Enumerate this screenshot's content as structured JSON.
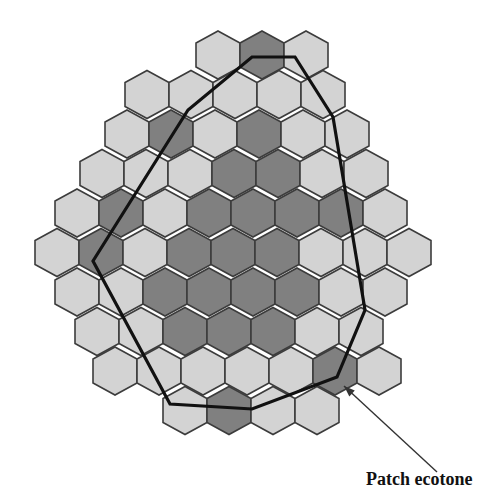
{
  "figure": {
    "label": "Patch ecotone",
    "colors": {
      "light_cell": "#d3d3d3",
      "dark_cell": "#808080",
      "cell_stroke": "#3c3c3c",
      "boundary": "#111111",
      "background": "#ffffff"
    },
    "grid": {
      "cell_shape": "pointy-top hexagon",
      "cell_width": 44,
      "half_height": 24,
      "rows": [
        {
          "cy": 55,
          "x0": 196,
          "cells": [
            "L",
            "D",
            "L"
          ]
        },
        {
          "cy": 94.5,
          "x0": 125,
          "cells": [
            "L",
            "L",
            "L",
            "L",
            "L"
          ]
        },
        {
          "cy": 134,
          "x0": 105,
          "cells": [
            "L",
            "D",
            "L",
            "D",
            "L",
            "L"
          ]
        },
        {
          "cy": 173.5,
          "x0": 80,
          "cells": [
            "L",
            "L",
            "L",
            "D",
            "D",
            "L",
            "L"
          ]
        },
        {
          "cy": 213,
          "x0": 55,
          "cells": [
            "L",
            "D",
            "L",
            "D",
            "D",
            "D",
            "D",
            "L"
          ]
        },
        {
          "cy": 252.5,
          "x0": 35,
          "cells": [
            "L",
            "D",
            "L",
            "D",
            "D",
            "D",
            "L",
            "L",
            "L"
          ]
        },
        {
          "cy": 292,
          "x0": 55,
          "cells": [
            "L",
            "L",
            "D",
            "D",
            "D",
            "D",
            "L",
            "L"
          ]
        },
        {
          "cy": 331.5,
          "x0": 75,
          "cells": [
            "L",
            "L",
            "D",
            "D",
            "D",
            "L",
            "L"
          ]
        },
        {
          "cy": 371,
          "x0": 93,
          "cells": [
            "L",
            "L",
            "L",
            "L",
            "L",
            "D",
            "L"
          ]
        },
        {
          "cy": 410.5,
          "x0": 163,
          "cells": [
            "L",
            "D",
            "L",
            "L"
          ]
        }
      ]
    },
    "boundary_polygon": [
      [
        252,
        57
      ],
      [
        295,
        57
      ],
      [
        333,
        117
      ],
      [
        365,
        310
      ],
      [
        337,
        377
      ],
      [
        252,
        409
      ],
      [
        170,
        404
      ],
      [
        93,
        261
      ],
      [
        188,
        110
      ]
    ],
    "arrow": {
      "from": [
        437,
        472
      ],
      "to": [
        344,
        386
      ]
    }
  }
}
